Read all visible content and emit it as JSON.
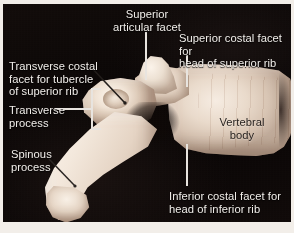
{
  "figure": {
    "background_color": "#0a0605",
    "frame_color": "#f2eee9",
    "label_color": "#f1eeea",
    "label_color_dark": "#241f1c",
    "bone_color": "#f0e3d5"
  },
  "labels": {
    "superior_articular_facet": "Superior\nartistic",
    "superior_articular_facet_text": "Superior\narticular facet",
    "superior_costal_facet": "Superior costal facet for\nhead of superior rib",
    "transverse_costal_facet": "Transverse costal\nfacet for tubercle\nof superior rib",
    "transverse_process": "Transverse\nprocess",
    "spinous_process": "Spinous\nprocess",
    "vertebral_body": "Vertebral\nbody",
    "inferior_costal_facet": "Inferior costal facet for\nhead of inferior rib"
  },
  "structures": [
    {
      "name": "superior-articular-facet",
      "label": "Superior articular facet"
    },
    {
      "name": "superior-costal-facet",
      "label": "Superior costal facet for head of superior rib"
    },
    {
      "name": "transverse-costal-facet",
      "label": "Transverse costal facet for tubercle of superior rib"
    },
    {
      "name": "transverse-process",
      "label": "Transverse process"
    },
    {
      "name": "spinous-process",
      "label": "Spinous process"
    },
    {
      "name": "vertebral-body",
      "label": "Vertebral body"
    },
    {
      "name": "inferior-costal-facet",
      "label": "Inferior costal facet for head of inferior rib"
    }
  ]
}
